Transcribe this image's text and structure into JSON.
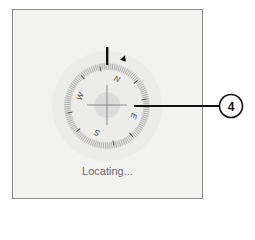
{
  "compass": {
    "state": "locating",
    "rotation_deg": 20,
    "cardinals": [
      {
        "label": "N",
        "angle": 0
      },
      {
        "label": "E",
        "angle": 90
      },
      {
        "label": "S",
        "angle": 180
      },
      {
        "label": "W",
        "angle": 270
      }
    ],
    "icons": [
      "north-marker-icon",
      "heading-triangle-icon",
      "crosshair-icon",
      "location-blob-icon"
    ]
  },
  "status": {
    "text": "Locating..."
  },
  "callout": {
    "number": "4",
    "color": "#111111"
  },
  "colors": {
    "background": "#f2f2f1",
    "ring": "#e2e2e0",
    "ticks": "#8c8c8c",
    "blob": "#dcdcdc",
    "text": "#6b6b6b"
  }
}
